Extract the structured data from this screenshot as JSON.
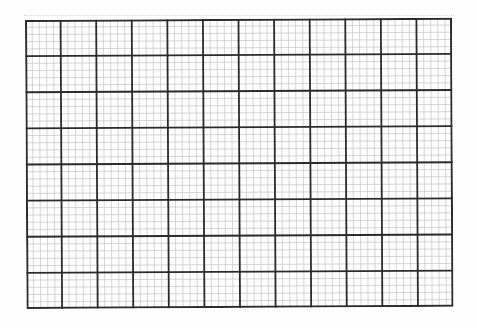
{
  "sheet": {
    "type": "graph-paper",
    "major_columns": 12,
    "major_rows": 8,
    "minor_per_major": 5,
    "colors": {
      "background": "#fefefe",
      "major_line": "#2b2b2b",
      "minor_line": "#c4c4c4",
      "border": "#2b2b2b"
    },
    "major_line_width": 1.8,
    "minor_line_width": 0.7
  }
}
